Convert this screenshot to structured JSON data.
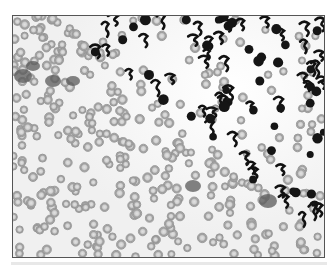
{
  "image": {
    "subject": "blood-smear-micrograph",
    "alt": "Grayscale micrograph of a peripheral blood smear: dense cluster of segmented neutrophils with lobulated dark nuclei in the upper right, transitioning to a field of pale biconcave red blood cells in the lower left",
    "colors": {
      "background": "#f4f4f4",
      "rbc_ring": "#9a9a9a",
      "rbc_center": "#d8d8d8",
      "nucleus": "#141414",
      "frame_border": "#555555"
    }
  }
}
